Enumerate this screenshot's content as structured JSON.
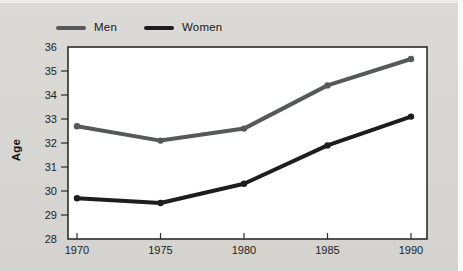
{
  "figure": {
    "background": "#d7d6d2",
    "plot_bg": "#ffffff",
    "frame_color": "#2b2b2b",
    "tick_color": "#2b2b2b",
    "text_color": "#1c1c1c"
  },
  "legend": {
    "items": [
      {
        "label": "Men",
        "color": "#57585a"
      },
      {
        "label": "Women",
        "color": "#1d1d1f"
      }
    ]
  },
  "chart_data": {
    "type": "line",
    "title": "",
    "xlabel": "",
    "ylabel": "Age",
    "x": [
      1970,
      1975,
      1980,
      1985,
      1990
    ],
    "xtick_labels": [
      "1970",
      "1975",
      "1980",
      "1985",
      "1990"
    ],
    "yticks": [
      28,
      29,
      30,
      31,
      32,
      33,
      34,
      35,
      36
    ],
    "ylim": [
      28,
      36
    ],
    "grid": false,
    "legend_position": "top-left",
    "series": [
      {
        "name": "Men",
        "color": "#57585a",
        "values": [
          32.7,
          32.1,
          32.6,
          34.4,
          35.5
        ]
      },
      {
        "name": "Women",
        "color": "#1d1d1f",
        "values": [
          29.7,
          29.5,
          30.3,
          31.9,
          33.1
        ]
      }
    ]
  }
}
